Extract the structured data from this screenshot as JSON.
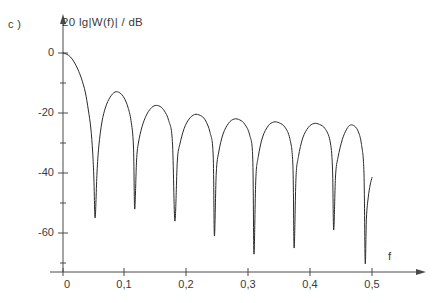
{
  "panel": {
    "label": "c )"
  },
  "axes": {
    "y_title": "20 lg|W(f)| / dB",
    "x_title": "f",
    "y_ticks": [
      "0",
      "-20",
      "-40",
      "-60"
    ],
    "x_ticks": [
      "0",
      "0,1",
      "0,2",
      "0,3",
      "0,4",
      "0,5"
    ]
  },
  "style": {
    "curve_color": "#2b2b2b",
    "axis_color": "#4a4a4a",
    "text_color": "#3a3a3a",
    "background": "#ffffff"
  },
  "chart_data": {
    "type": "line",
    "title": "",
    "xlabel": "f",
    "ylabel": "20 lg|W(f)| / dB",
    "xlim": [
      0,
      0.5
    ],
    "ylim": [
      -73,
      3
    ],
    "grid": false,
    "legend": null,
    "x_tick_values": [
      0,
      0.1,
      0.2,
      0.3,
      0.4,
      0.5
    ],
    "x_tick_labels": [
      "0",
      "0,1",
      "0,2",
      "0,3",
      "0,4",
      "0,5"
    ],
    "y_tick_values": [
      0,
      -20,
      -40,
      -60
    ],
    "y_tick_labels": [
      "0",
      "-20",
      "-40",
      "-60"
    ],
    "y_minor_tick_values": [
      -10,
      -30,
      -50,
      -70
    ],
    "nulls_f": [
      0.052,
      0.116,
      0.181,
      0.245,
      0.309,
      0.374,
      0.438,
      0.489
    ],
    "nulls_db": [
      -55,
      -52,
      -56,
      -61,
      -67,
      -65,
      -59,
      -70
    ],
    "sidelobe_peaks_f": [
      0.084,
      0.149,
      0.213,
      0.277,
      0.341,
      0.406,
      0.465
    ],
    "sidelobe_peaks_db": [
      -13.0,
      -17.5,
      -20.5,
      -22.0,
      -23.0,
      -23.5,
      -24.0
    ],
    "series": [
      {
        "name": "20 lg|W(f)|",
        "x": [
          0.0,
          0.006,
          0.012,
          0.018,
          0.024,
          0.03,
          0.036,
          0.041,
          0.045,
          0.048,
          0.05,
          0.052,
          0.055,
          0.058,
          0.063,
          0.069,
          0.076,
          0.084,
          0.092,
          0.099,
          0.105,
          0.11,
          0.114,
          0.116,
          0.119,
          0.122,
          0.128,
          0.135,
          0.142,
          0.149,
          0.157,
          0.164,
          0.171,
          0.177,
          0.181,
          0.185,
          0.189,
          0.196,
          0.204,
          0.213,
          0.222,
          0.23,
          0.238,
          0.243,
          0.245,
          0.248,
          0.252,
          0.259,
          0.268,
          0.277,
          0.286,
          0.294,
          0.302,
          0.307,
          0.309,
          0.312,
          0.316,
          0.323,
          0.332,
          0.341,
          0.35,
          0.359,
          0.367,
          0.372,
          0.374,
          0.377,
          0.381,
          0.388,
          0.397,
          0.406,
          0.415,
          0.424,
          0.432,
          0.436,
          0.438,
          0.441,
          0.445,
          0.452,
          0.459,
          0.465,
          0.472,
          0.478,
          0.483,
          0.487,
          0.489,
          0.491,
          0.494,
          0.497,
          0.5
        ],
        "y": [
          0.0,
          -0.4,
          -1.3,
          -3.0,
          -5.4,
          -8.6,
          -13.0,
          -19.0,
          -25.0,
          -33.0,
          -42.0,
          -55.0,
          -40.0,
          -31.0,
          -23.0,
          -18.0,
          -14.8,
          -13.0,
          -13.3,
          -15.0,
          -18.0,
          -22.5,
          -31.0,
          -52.0,
          -36.0,
          -30.0,
          -24.5,
          -20.7,
          -18.5,
          -17.5,
          -17.8,
          -19.3,
          -22.5,
          -29.5,
          -56.0,
          -36.0,
          -30.5,
          -25.2,
          -22.0,
          -20.5,
          -20.8,
          -22.3,
          -26.5,
          -34.0,
          -61.0,
          -40.0,
          -33.0,
          -27.0,
          -23.4,
          -22.0,
          -22.3,
          -23.7,
          -27.3,
          -35.0,
          -67.0,
          -42.0,
          -34.5,
          -28.0,
          -24.3,
          -23.0,
          -23.3,
          -24.7,
          -28.5,
          -37.5,
          -65.0,
          -41.5,
          -34.5,
          -28.3,
          -24.8,
          -23.5,
          -23.8,
          -25.2,
          -29.2,
          -38.0,
          -59.0,
          -41.0,
          -34.8,
          -28.8,
          -25.4,
          -24.0,
          -24.4,
          -26.3,
          -30.5,
          -40.0,
          -70.0,
          -55.0,
          -48.0,
          -44.0,
          -41.5
        ]
      }
    ]
  }
}
